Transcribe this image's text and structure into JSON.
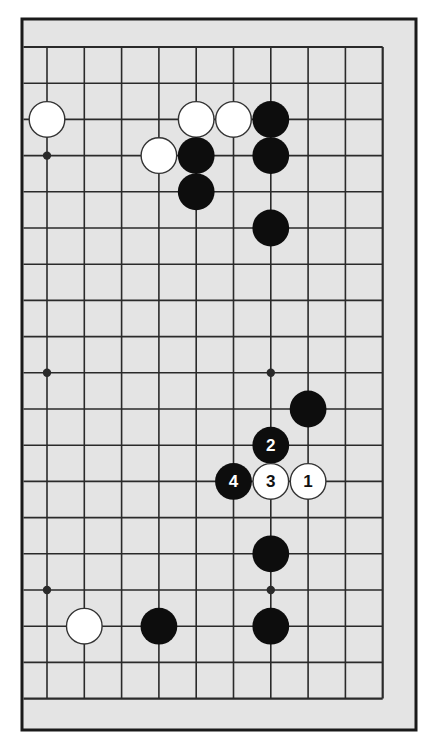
{
  "diagram": {
    "type": "go-board-partial",
    "visible_columns": 10,
    "visible_rows": 19,
    "edges_shown": [
      "top",
      "right",
      "bottom"
    ],
    "colors": {
      "background": "#ffffff",
      "board": "#e4e4e4",
      "frame": "#1a1a1a",
      "line": "#2a2a2a",
      "black_stone": "#0d0d0d",
      "white_stone": "#ffffff",
      "white_stone_border": "#333333",
      "label_on_black": "#ffffff",
      "label_on_white": "#111111"
    },
    "star_points": [
      {
        "col": 0,
        "row": 3
      },
      {
        "col": 0,
        "row": 9
      },
      {
        "col": 0,
        "row": 15
      },
      {
        "col": 6,
        "row": 9
      },
      {
        "col": 6,
        "row": 15
      }
    ],
    "stones": [
      {
        "col": 0,
        "row": 2,
        "color": "white",
        "label": ""
      },
      {
        "col": 4,
        "row": 2,
        "color": "white",
        "label": ""
      },
      {
        "col": 5,
        "row": 2,
        "color": "white",
        "label": ""
      },
      {
        "col": 6,
        "row": 2,
        "color": "black",
        "label": ""
      },
      {
        "col": 3,
        "row": 3,
        "color": "white",
        "label": ""
      },
      {
        "col": 4,
        "row": 3,
        "color": "black",
        "label": ""
      },
      {
        "col": 6,
        "row": 3,
        "color": "black",
        "label": ""
      },
      {
        "col": 4,
        "row": 4,
        "color": "black",
        "label": ""
      },
      {
        "col": 6,
        "row": 5,
        "color": "black",
        "label": ""
      },
      {
        "col": 7,
        "row": 10,
        "color": "black",
        "label": ""
      },
      {
        "col": 6,
        "row": 11,
        "color": "black",
        "label": "2"
      },
      {
        "col": 5,
        "row": 12,
        "color": "black",
        "label": "4"
      },
      {
        "col": 6,
        "row": 12,
        "color": "white",
        "label": "3"
      },
      {
        "col": 7,
        "row": 12,
        "color": "white",
        "label": "1"
      },
      {
        "col": 6,
        "row": 14,
        "color": "black",
        "label": ""
      },
      {
        "col": 1,
        "row": 16,
        "color": "white",
        "label": ""
      },
      {
        "col": 3,
        "row": 16,
        "color": "black",
        "label": ""
      },
      {
        "col": 6,
        "row": 16,
        "color": "black",
        "label": ""
      }
    ],
    "move_sequence": [
      {
        "move": "1",
        "color": "white"
      },
      {
        "move": "2",
        "color": "black"
      },
      {
        "move": "3",
        "color": "white"
      },
      {
        "move": "4",
        "color": "black"
      }
    ]
  }
}
